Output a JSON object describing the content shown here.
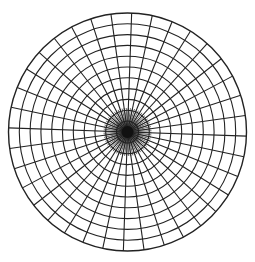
{
  "diagram": {
    "type": "polar-grid",
    "center": {
      "x": 127.5,
      "y": 132
    },
    "outer_radius": 119,
    "ring_count": 11,
    "ring_spacing": 10.8,
    "spoke_count": 36,
    "spoke_angle_deg": 10,
    "inner_dense_spoke_count": 72,
    "inner_dense_radius": 24,
    "line_color": "#222222",
    "background": "#ffffff",
    "hub_color": "#111111"
  }
}
